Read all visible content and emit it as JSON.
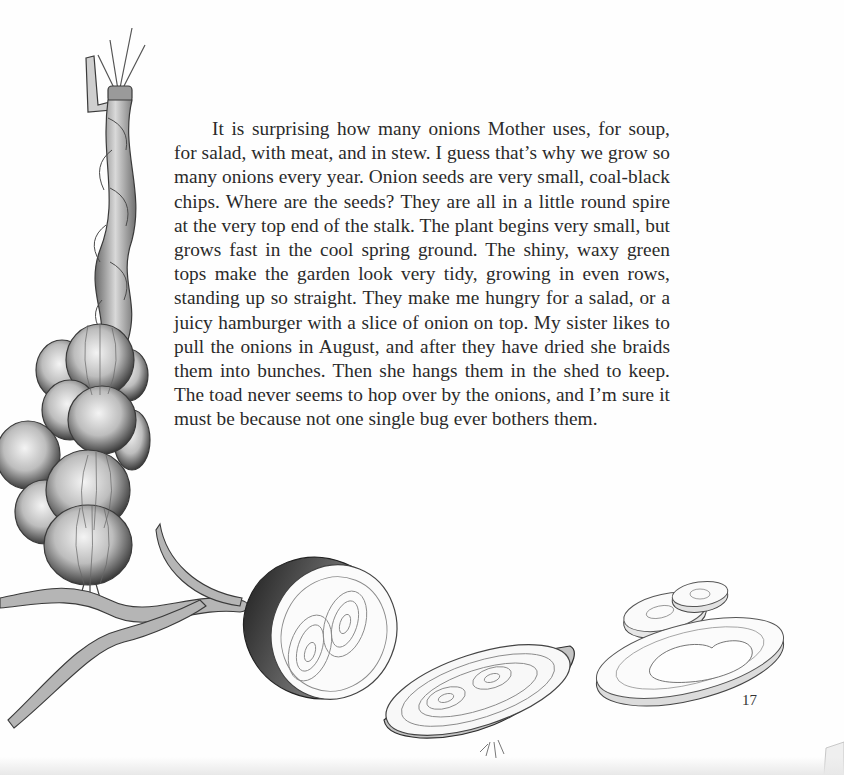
{
  "page": {
    "body_text": "It is surprising how many onions Mother uses, for soup, for salad, with meat, and in stew. I guess that’s why we grow so many onions every year. Onion seeds are very small, coal-black chips. Where are the seeds? They are all in a little round spire at the very top end of the stalk. The plant begins very small, but grows fast in the cool spring ground. The shiny, waxy green tops make the garden look very tidy, growing in even rows, standing up so straight. They make me hungry for a salad, or a juicy ham­burger with a slice of onion on top. My sister likes to pull the onions in August, and after they have dried she braids them into bunches. Then she hangs them in the shed to keep. The toad never seems to hop over by the onions, and I’m sure it must be because not one single bug ever bothers them.",
    "page_number": "17"
  },
  "illustrations": [
    {
      "name": "braided-onion-string",
      "description": "Braided onion tops hanging with a cluster of onion bulbs"
    },
    {
      "name": "onion-half-cut",
      "description": "Onion cut in half showing double-centered rings"
    },
    {
      "name": "onion-half-lying",
      "description": "Onion half lying on its side with roots"
    },
    {
      "name": "onion-slices",
      "description": "Onion slices and a ring"
    }
  ],
  "colors": {
    "paper": "#fefefe",
    "ink": "#2a2a2a",
    "pencil": "#555555"
  }
}
